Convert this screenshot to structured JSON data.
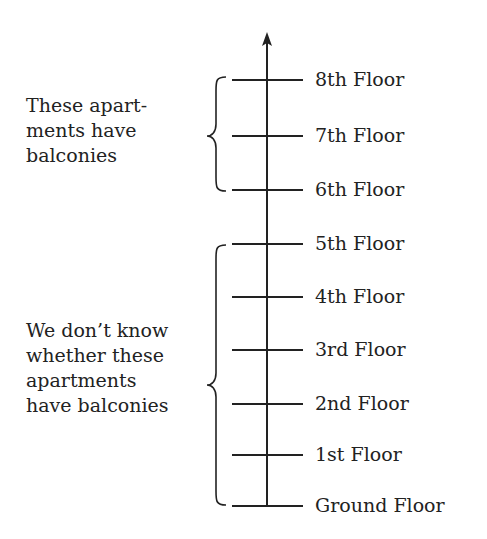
{
  "diagram": {
    "axis": {
      "x": 267,
      "top": 32,
      "bottom": 506,
      "color": "#222222"
    },
    "tick": {
      "x1": 232,
      "x2": 303
    },
    "floors": [
      {
        "label": "8th Floor",
        "y": 80
      },
      {
        "label": "7th Floor",
        "y": 136
      },
      {
        "label": "6th Floor",
        "y": 190
      },
      {
        "label": "5th Floor",
        "y": 244
      },
      {
        "label": "4th Floor",
        "y": 297
      },
      {
        "label": "3rd Floor",
        "y": 350
      },
      {
        "label": "2nd Floor",
        "y": 404
      },
      {
        "label": "1st Floor",
        "y": 455
      },
      {
        "label": "Ground Floor",
        "y": 506
      }
    ],
    "groups": [
      {
        "lines": [
          "These apart-",
          "ments have",
          "balconies"
        ],
        "brace": {
          "top": 77,
          "bottom": 191,
          "mid": 136
        },
        "label_top": 93
      },
      {
        "lines": [
          "We don’t know",
          "whether these",
          "apartments",
          "have balconies"
        ],
        "brace": {
          "top": 245,
          "bottom": 505,
          "mid": 385
        },
        "label_top": 318
      }
    ]
  }
}
